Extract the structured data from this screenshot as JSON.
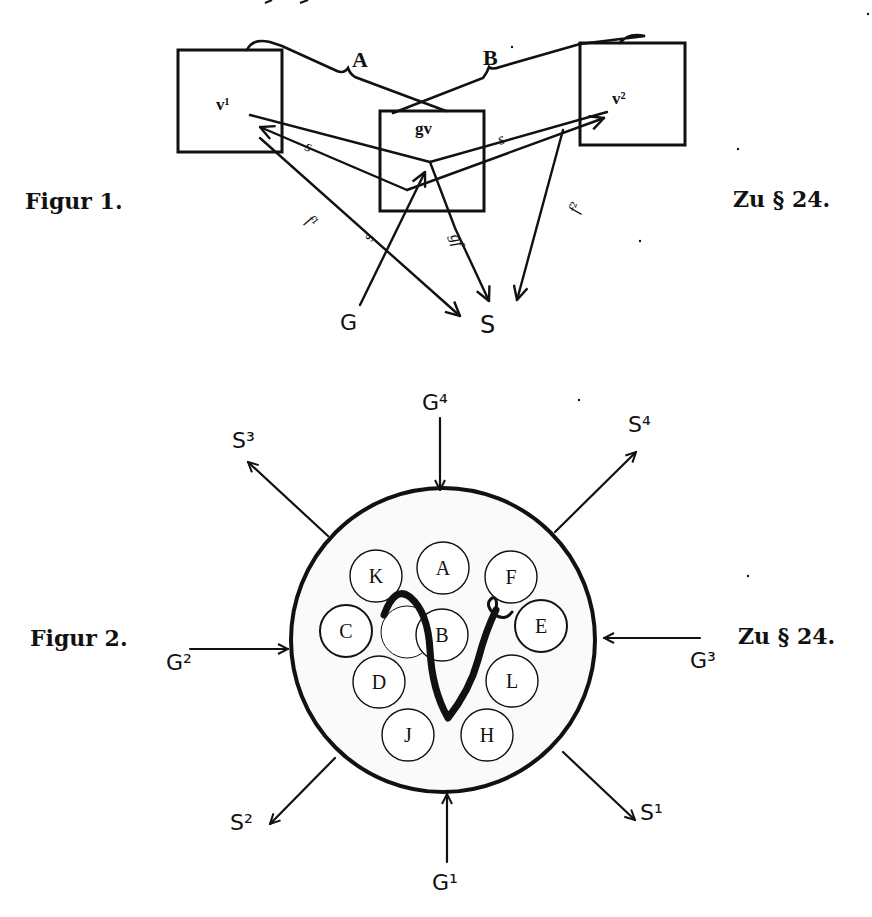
{
  "colors": {
    "ink": "#111111",
    "paper": "#ffffff",
    "inner_fill": "#fafafa"
  },
  "figure1": {
    "caption": "Figur 1.",
    "reference": "Zu § 24.",
    "boxes": {
      "left": "v¹",
      "center": "gv",
      "right": "v²"
    },
    "connectors": {
      "a": "A",
      "b": "B"
    },
    "arrow_labels": {
      "s_left": "s",
      "s_right": "s",
      "s_up": "s",
      "f1": "f¹",
      "gf": "gf",
      "f2": "f²"
    },
    "nodes": {
      "g": "G",
      "s": "S"
    }
  },
  "figure2": {
    "caption": "Figur 2.",
    "reference": "Zu § 24.",
    "center_glyph": "𝔳",
    "inner_circles": [
      "K",
      "A",
      "F",
      "C",
      "B",
      "E",
      "D",
      "L",
      "J",
      "H"
    ],
    "inputs": {
      "g1": "G¹",
      "g2": "G²",
      "g3": "G³",
      "g4": "G⁴"
    },
    "outputs": {
      "s1": "S¹",
      "s2": "S²",
      "s3": "S³",
      "s4": "S⁴"
    }
  }
}
